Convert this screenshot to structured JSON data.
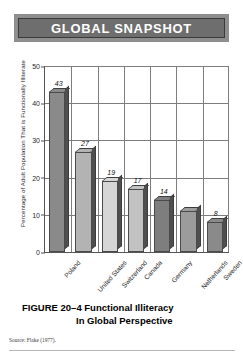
{
  "banner": {
    "title": "GLOBAL SNAPSHOT"
  },
  "caption": {
    "line1": "FIGURE 20–4  Functional Illiteracy",
    "line2": "In Global Perspective",
    "source": "Source:  Flake (1977)."
  },
  "chart_data": {
    "type": "bar",
    "title": "GLOBAL SNAPSHOT",
    "xlabel": "",
    "ylabel": "Percentage of Adult Population That is Functionally Illiterate",
    "ylim": [
      0,
      50
    ],
    "yticks": [
      0,
      10,
      20,
      30,
      40,
      50
    ],
    "grid": true,
    "legend": false,
    "categories": [
      "Poland",
      "United States",
      "Switzerland",
      "Canada",
      "Germany",
      "Netherlands",
      "Sweden"
    ],
    "values": [
      43,
      27,
      19,
      17,
      14,
      11,
      8
    ],
    "data_labels": [
      "43",
      "27",
      "19",
      "17",
      "14",
      "",
      "8"
    ],
    "bar_colors": [
      "#8a8a8a",
      "#b3b3b3",
      "#d6d6d6",
      "#c2c2c2",
      "#7e7e7e",
      "#9c9c9c",
      "#8a8a8a"
    ]
  }
}
